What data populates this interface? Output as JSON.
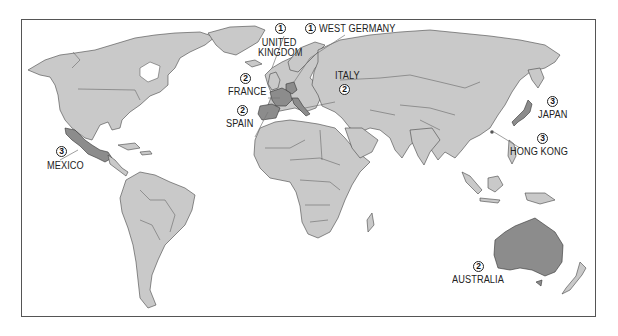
{
  "map": {
    "type": "world-political-outline",
    "colors": {
      "land": "#c9c9c9",
      "highlighted": "#8c8c8c",
      "border": "#444444",
      "frame": "#555555",
      "water": "#ffffff"
    },
    "markers": [
      {
        "id": "united-kingdom",
        "rank": "1",
        "label_lines": [
          "UNITED",
          "KINGDOM"
        ]
      },
      {
        "id": "west-germany",
        "rank": "1",
        "label_lines": [
          "WEST GERMANY"
        ]
      },
      {
        "id": "france",
        "rank": "2",
        "label_lines": [
          "FRANCE"
        ]
      },
      {
        "id": "italy",
        "rank": "2",
        "label_lines": [
          "ITALY"
        ]
      },
      {
        "id": "spain",
        "rank": "2",
        "label_lines": [
          "SPAIN"
        ]
      },
      {
        "id": "japan",
        "rank": "3",
        "label_lines": [
          "JAPAN"
        ]
      },
      {
        "id": "hong-kong",
        "rank": "3",
        "label_lines": [
          "HONG KONG"
        ]
      },
      {
        "id": "mexico",
        "rank": "3",
        "label_lines": [
          "MEXICO"
        ]
      },
      {
        "id": "australia",
        "rank": "2",
        "label_lines": [
          "AUSTRALIA"
        ]
      }
    ]
  }
}
